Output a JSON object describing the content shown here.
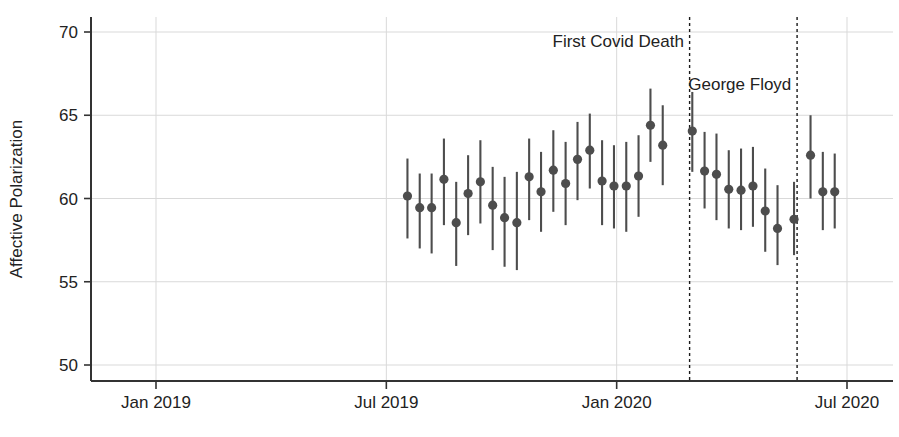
{
  "chart_data": {
    "type": "scatter",
    "title": "",
    "subtitle": "",
    "xlabel": "",
    "ylabel": "Affective Polarization",
    "ylim": [
      48.0,
      71.0
    ],
    "xlim_months": [
      -1.0,
      19.2
    ],
    "grid": true,
    "legend_position": "none",
    "marker": "filled-circle-with-vertical-error-bars",
    "series_color": "#4d4d4d",
    "grid_color": "#d9d9d9",
    "axis_color": "#333333",
    "y_ticks": [
      50,
      55,
      60,
      65,
      70
    ],
    "y_tick_labels": [
      "50",
      "55",
      "60",
      "65",
      "70"
    ],
    "x_ticks_months": [
      0,
      6,
      12,
      18
    ],
    "x_tick_labels": [
      "Jan 2019",
      "Jul 2019",
      "Jan 2020",
      "Jul 2020"
    ],
    "annotations": [
      {
        "label": "First Covid Death",
        "x_month": 13.9,
        "line": "dashed",
        "text_anchor": "end",
        "text_x_month": 13.75,
        "text_y": 69.1
      },
      {
        "label": "George Floyd",
        "x_month": 16.7,
        "line": "dashed",
        "text_anchor": "end",
        "text_x_month": 16.55,
        "text_y": 66.5
      }
    ],
    "x_unit": "months since Jan 2019",
    "points": [
      {
        "x_month": 6.55,
        "y": 60.15,
        "lo": 57.6,
        "hi": 62.4
      },
      {
        "x_month": 6.87,
        "y": 59.45,
        "lo": 57.0,
        "hi": 61.5
      },
      {
        "x_month": 7.18,
        "y": 59.45,
        "lo": 56.7,
        "hi": 61.5
      },
      {
        "x_month": 7.5,
        "y": 61.15,
        "lo": 58.4,
        "hi": 63.6
      },
      {
        "x_month": 7.82,
        "y": 58.55,
        "lo": 55.95,
        "hi": 61.0
      },
      {
        "x_month": 8.13,
        "y": 60.3,
        "lo": 57.8,
        "hi": 62.6
      },
      {
        "x_month": 8.45,
        "y": 61.0,
        "lo": 58.5,
        "hi": 63.5
      },
      {
        "x_month": 8.77,
        "y": 59.6,
        "lo": 56.9,
        "hi": 61.9
      },
      {
        "x_month": 9.08,
        "y": 58.85,
        "lo": 55.9,
        "hi": 61.3
      },
      {
        "x_month": 9.4,
        "y": 58.55,
        "lo": 55.7,
        "hi": 61.6
      },
      {
        "x_month": 9.72,
        "y": 61.3,
        "lo": 58.7,
        "hi": 63.6
      },
      {
        "x_month": 10.03,
        "y": 60.4,
        "lo": 58.0,
        "hi": 62.8
      },
      {
        "x_month": 10.35,
        "y": 61.7,
        "lo": 59.2,
        "hi": 64.1
      },
      {
        "x_month": 10.67,
        "y": 60.9,
        "lo": 58.4,
        "hi": 63.4
      },
      {
        "x_month": 10.98,
        "y": 62.35,
        "lo": 59.9,
        "hi": 64.6
      },
      {
        "x_month": 11.3,
        "y": 62.9,
        "lo": 60.6,
        "hi": 65.1
      },
      {
        "x_month": 11.62,
        "y": 61.05,
        "lo": 58.4,
        "hi": 63.5
      },
      {
        "x_month": 11.93,
        "y": 60.75,
        "lo": 58.2,
        "hi": 63.2
      },
      {
        "x_month": 12.25,
        "y": 60.75,
        "lo": 58.0,
        "hi": 63.4
      },
      {
        "x_month": 12.57,
        "y": 61.35,
        "lo": 58.9,
        "hi": 63.8
      },
      {
        "x_month": 12.88,
        "y": 64.4,
        "lo": 62.2,
        "hi": 66.6
      },
      {
        "x_month": 13.2,
        "y": 63.2,
        "lo": 60.8,
        "hi": 65.6
      },
      {
        "x_month": 13.97,
        "y": 64.05,
        "lo": 61.6,
        "hi": 66.4
      },
      {
        "x_month": 14.29,
        "y": 61.65,
        "lo": 59.4,
        "hi": 64.0
      },
      {
        "x_month": 14.6,
        "y": 61.45,
        "lo": 58.7,
        "hi": 63.9
      },
      {
        "x_month": 14.92,
        "y": 60.55,
        "lo": 58.2,
        "hi": 62.9
      },
      {
        "x_month": 15.24,
        "y": 60.5,
        "lo": 58.1,
        "hi": 63.0
      },
      {
        "x_month": 15.55,
        "y": 60.75,
        "lo": 58.3,
        "hi": 63.1
      },
      {
        "x_month": 15.87,
        "y": 59.25,
        "lo": 56.8,
        "hi": 61.8
      },
      {
        "x_month": 16.19,
        "y": 58.2,
        "lo": 56.0,
        "hi": 60.8
      },
      {
        "x_month": 16.62,
        "y": 58.75,
        "lo": 56.6,
        "hi": 61.0
      },
      {
        "x_month": 17.05,
        "y": 62.6,
        "lo": 60.0,
        "hi": 65.0
      },
      {
        "x_month": 17.37,
        "y": 60.4,
        "lo": 58.1,
        "hi": 62.8
      },
      {
        "x_month": 17.68,
        "y": 60.4,
        "lo": 58.2,
        "hi": 62.7
      }
    ]
  },
  "axis": {
    "ylabel": "Affective Polarization"
  }
}
